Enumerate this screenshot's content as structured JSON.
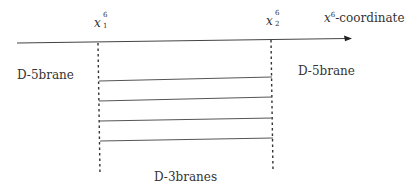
{
  "diagram": {
    "axis": {
      "label_var": "x",
      "label_sup": "6",
      "label_suffix": "-coordinate",
      "color": "#333333"
    },
    "positions": [
      {
        "var": "x",
        "sup": "6",
        "sub": "1"
      },
      {
        "var": "x",
        "sup": "6",
        "sub": "2"
      }
    ],
    "left_brane_label": "D-5brane",
    "right_brane_label": "D-5brane",
    "stack_label": "D-3branes",
    "d3_count": 4
  }
}
